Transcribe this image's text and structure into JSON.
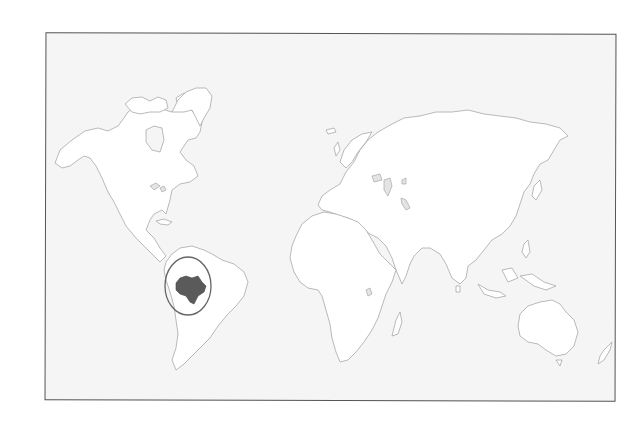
{
  "map": {
    "type": "world-locator-map",
    "highlighted_country": "Venezuela",
    "colors": {
      "background": "#f5f5f5",
      "land": "#ffffff",
      "coastline": "#a8a8a8",
      "highlight": "#5a5a5a",
      "frame": "#555555",
      "ring": "#666666"
    },
    "continents": [
      "North America",
      "South America",
      "Europe",
      "Africa",
      "Asia",
      "Australia"
    ]
  }
}
